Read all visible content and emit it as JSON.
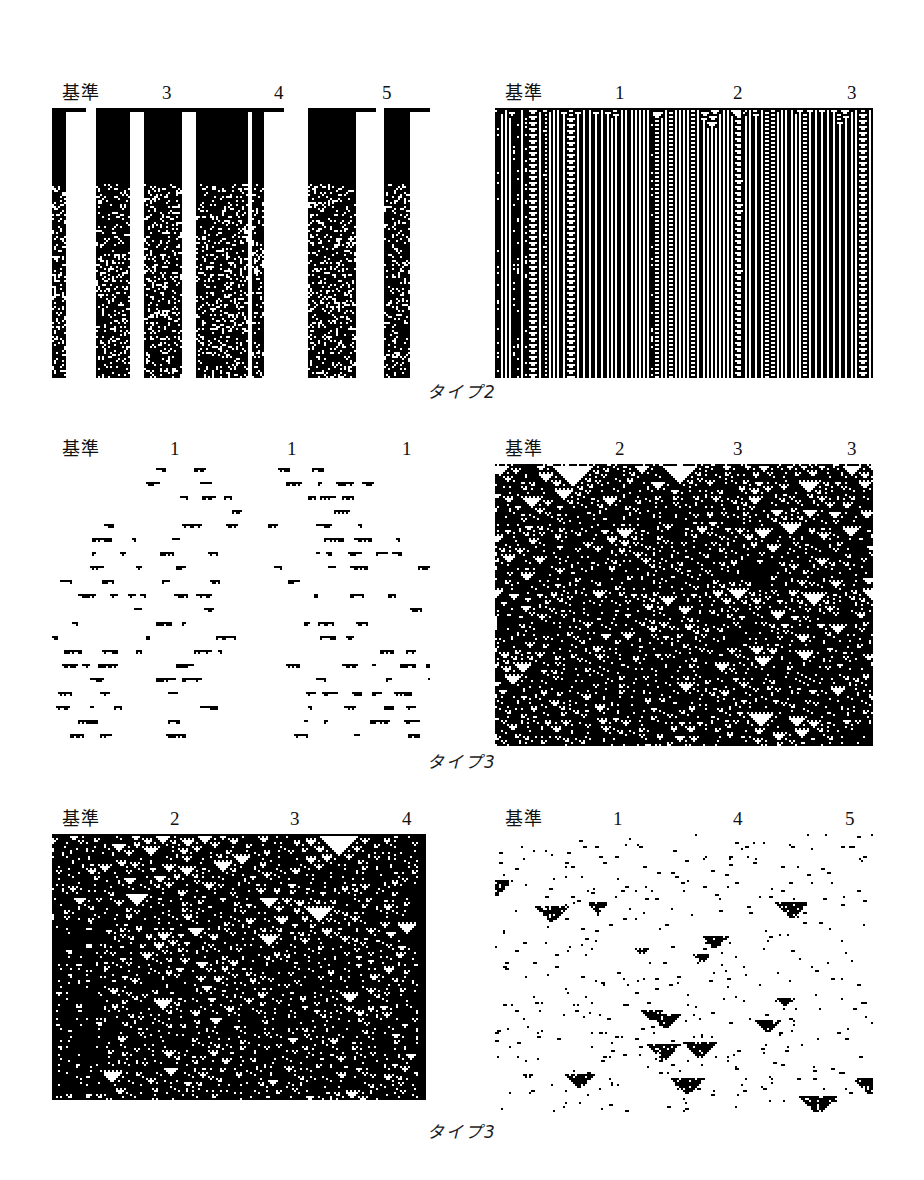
{
  "figure": {
    "background": "#ffffff",
    "ink": "#000000",
    "rows": [
      {
        "id": "row-1",
        "caption": "タイプ2",
        "panels": [
          {
            "id": "panel-1",
            "position": "left",
            "headers": [
              {
                "label": "基準",
                "x": 10
              },
              {
                "label": "3",
                "x": 110
              },
              {
                "label": "4",
                "x": 222
              },
              {
                "label": "5",
                "x": 330
              }
            ],
            "rule_class": "type2",
            "seed": 1201,
            "density": 0.55,
            "style": "stripes-dense",
            "left": 52,
            "top": 108,
            "width": 378,
            "height": 270
          },
          {
            "id": "panel-2",
            "position": "right",
            "headers": [
              {
                "label": "基準",
                "x": 10
              },
              {
                "label": "1",
                "x": 120
              },
              {
                "label": "2",
                "x": 238
              },
              {
                "label": "3",
                "x": 352
              }
            ],
            "rule_class": "type2",
            "seed": 2207,
            "density": 0.5,
            "style": "nested-branch",
            "left": 495,
            "top": 108,
            "width": 378,
            "height": 270
          }
        ]
      },
      {
        "id": "row-2",
        "caption": "タイプ3",
        "panels": [
          {
            "id": "panel-3",
            "position": "left",
            "headers": [
              {
                "label": "基準",
                "x": 10
              },
              {
                "label": "1",
                "x": 118
              },
              {
                "label": "1",
                "x": 235
              },
              {
                "label": "1",
                "x": 350
              }
            ],
            "rule_class": "type3",
            "seed": 3301,
            "density": 0.22,
            "style": "sparse-dash",
            "left": 52,
            "top": 464,
            "width": 378,
            "height": 282
          },
          {
            "id": "panel-4",
            "position": "right",
            "headers": [
              {
                "label": "基準",
                "x": 10
              },
              {
                "label": "2",
                "x": 120
              },
              {
                "label": "3",
                "x": 238
              },
              {
                "label": "3",
                "x": 352
              }
            ],
            "rule_class": "type3",
            "seed": 4403,
            "density": 0.46,
            "style": "sierpinski",
            "left": 495,
            "top": 464,
            "width": 378,
            "height": 282
          }
        ]
      },
      {
        "id": "row-3",
        "caption": "タイプ3",
        "panels": [
          {
            "id": "panel-5",
            "position": "left",
            "headers": [
              {
                "label": "基準",
                "x": 10
              },
              {
                "label": "2",
                "x": 118
              },
              {
                "label": "3",
                "x": 238
              },
              {
                "label": "4",
                "x": 350
              }
            ],
            "rule_class": "type3",
            "seed": 5501,
            "density": 0.5,
            "style": "sierpinski-dense",
            "left": 52,
            "top": 834,
            "width": 375,
            "height": 266
          },
          {
            "id": "panel-6",
            "position": "right",
            "headers": [
              {
                "label": "基準",
                "x": 10
              },
              {
                "label": "1",
                "x": 118
              },
              {
                "label": "4",
                "x": 238
              },
              {
                "label": "5",
                "x": 350
              }
            ],
            "rule_class": "type3",
            "seed": 6607,
            "density": 0.3,
            "style": "scatter-triangles",
            "left": 495,
            "top": 834,
            "width": 378,
            "height": 278
          }
        ]
      }
    ]
  }
}
